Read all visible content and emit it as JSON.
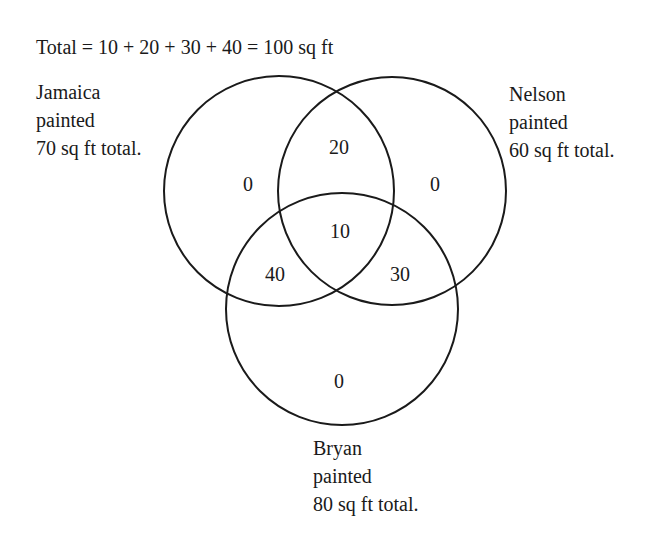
{
  "title": "Total = 10 + 20 + 30 + 40 = 100 sq ft",
  "sets": [
    {
      "name": "Jamaica",
      "label_lines": [
        "Jamaica",
        "painted",
        "70 sq ft total."
      ],
      "total": 70,
      "circle": {
        "cx": 279,
        "cy": 191,
        "r": 115
      }
    },
    {
      "name": "Nelson",
      "label_lines": [
        "Nelson",
        "painted",
        "60 sq ft total."
      ],
      "total": 60,
      "circle": {
        "cx": 392,
        "cy": 191,
        "r": 114
      }
    },
    {
      "name": "Bryan",
      "label_lines": [
        "Bryan",
        "painted",
        "80 sq ft total."
      ],
      "total": 80,
      "circle": {
        "cx": 342,
        "cy": 309,
        "r": 116
      }
    }
  ],
  "regions": {
    "jamaica_only": "0",
    "nelson_only": "0",
    "bryan_only": "0",
    "jamaica_nelson": "20",
    "all_three": "10",
    "jamaica_bryan": "40",
    "nelson_bryan": "30"
  },
  "colors": {
    "stroke": "#1a1a1a",
    "text": "#1a1a1a",
    "background": "#ffffff"
  }
}
